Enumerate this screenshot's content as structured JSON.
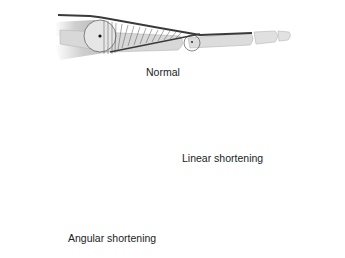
{
  "diagram": {
    "type": "anatomical-illustration",
    "colors": {
      "bone": "#d8d8d8",
      "bone_outline": "#b5b5b5",
      "tendon": "#3a3a3a",
      "hatching": "#555555",
      "background": "#ffffff"
    },
    "panels": [
      {
        "id": "normal",
        "label": "Normal"
      },
      {
        "id": "linear",
        "label": "Linear shortening"
      },
      {
        "id": "angular",
        "label": "Angular shortening"
      }
    ]
  }
}
